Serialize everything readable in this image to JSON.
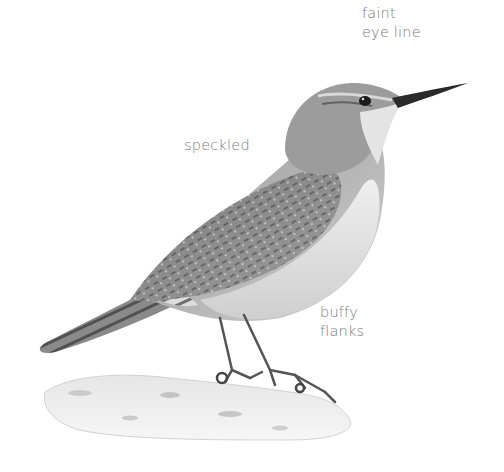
{
  "illustration": {
    "subject": "wren-bird-illustration",
    "palette": {
      "background": "#ffffff",
      "plumage_dark": "#5a5a5a",
      "plumage_mid": "#8c8c8c",
      "plumage_light": "#c8c8c8",
      "belly": "#e4e4e4",
      "label_text": "#7a7a7a"
    }
  },
  "labels": {
    "eye_line": {
      "line1": "faint",
      "line2": "eye line"
    },
    "speckled": {
      "line1": "speckled"
    },
    "flanks": {
      "line1": "buffy",
      "line2": "flanks"
    }
  }
}
